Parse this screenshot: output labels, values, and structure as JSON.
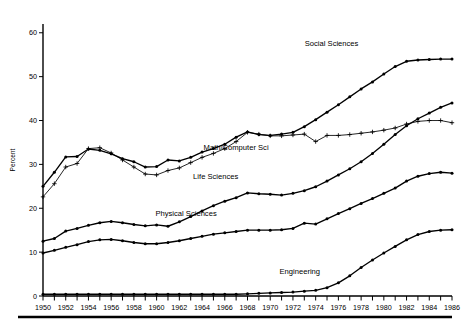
{
  "chart_data": {
    "type": "line",
    "title": "",
    "xlabel": "",
    "ylabel": "Percent",
    "xlim": [
      1950,
      1986
    ],
    "ylim": [
      0,
      62
    ],
    "yticks": [
      0,
      10,
      20,
      30,
      40,
      50,
      60
    ],
    "ytick_labels": [
      "0",
      "10",
      "20",
      "30",
      "40",
      "50",
      "60"
    ],
    "xticks": [
      1950,
      1951,
      1952,
      1953,
      1954,
      1955,
      1956,
      1957,
      1958,
      1959,
      1960,
      1961,
      1962,
      1963,
      1964,
      1965,
      1966,
      1967,
      1968,
      1969,
      1970,
      1971,
      1972,
      1973,
      1974,
      1975,
      1976,
      1977,
      1978,
      1979,
      1980,
      1981,
      1982,
      1983,
      1984,
      1985,
      1986
    ],
    "xtick_labels": [
      "1950",
      "1952",
      "1954",
      "1956",
      "1958",
      "1960",
      "1962",
      "1964",
      "1966",
      "1968",
      "1970",
      "1972",
      "1974",
      "1976",
      "1978",
      "1980",
      "1982",
      "1984",
      "1986"
    ],
    "xtick_label_years": [
      1950,
      1952,
      1954,
      1956,
      1958,
      1960,
      1962,
      1964,
      1966,
      1968,
      1970,
      1972,
      1974,
      1976,
      1978,
      1980,
      1982,
      1984,
      1986
    ],
    "grid": false,
    "legend_position": "inline-annotations",
    "x": [
      1950,
      1951,
      1952,
      1953,
      1954,
      1955,
      1956,
      1957,
      1958,
      1959,
      1960,
      1961,
      1962,
      1963,
      1964,
      1965,
      1966,
      1967,
      1968,
      1969,
      1970,
      1971,
      1972,
      1973,
      1974,
      1975,
      1976,
      1977,
      1978,
      1979,
      1980,
      1981,
      1982,
      1983,
      1984,
      1985,
      1986
    ],
    "series": [
      {
        "name": "Social Sciences",
        "marker": "dot",
        "line_weight": "thick",
        "label_x": 1975.4,
        "label_y": 57.0,
        "values": [
          25.0,
          28.2,
          31.7,
          31.8,
          33.5,
          33.2,
          32.4,
          31.3,
          30.6,
          29.4,
          29.5,
          31.0,
          30.8,
          31.6,
          32.8,
          33.6,
          34.6,
          36.2,
          37.4,
          36.8,
          36.6,
          36.9,
          37.3,
          38.6,
          40.2,
          41.9,
          43.6,
          45.4,
          47.2,
          48.8,
          50.6,
          52.3,
          53.5,
          53.8,
          53.9,
          54.0,
          54.0
        ]
      },
      {
        "name": "Math/Computer Sci",
        "marker": "plus",
        "line_weight": "thin",
        "label_x": 1967.0,
        "label_y": 33.4,
        "values": [
          22.6,
          25.6,
          29.4,
          30.2,
          33.6,
          33.8,
          32.6,
          31.0,
          29.4,
          27.8,
          27.6,
          28.6,
          29.2,
          30.4,
          31.6,
          32.5,
          33.6,
          35.2,
          37.3,
          36.9,
          36.5,
          36.5,
          36.7,
          36.9,
          35.2,
          36.6,
          36.6,
          36.8,
          37.1,
          37.4,
          37.8,
          38.3,
          39.2,
          39.8,
          40.0,
          40.0,
          39.5
        ]
      },
      {
        "name": "Life Sciences",
        "marker": "dot",
        "line_weight": "thick",
        "label_x": 1965.2,
        "label_y": 26.6,
        "values": [
          12.5,
          13.1,
          14.8,
          15.4,
          16.1,
          16.7,
          17.0,
          16.7,
          16.3,
          16.0,
          16.2,
          15.9,
          16.9,
          18.1,
          19.4,
          20.6,
          21.6,
          22.4,
          23.5,
          23.3,
          23.2,
          23.0,
          23.4,
          24.0,
          24.9,
          26.2,
          27.6,
          29.0,
          30.6,
          32.5,
          34.6,
          36.8,
          38.8,
          40.4,
          41.7,
          43.0,
          44.0
        ]
      },
      {
        "name": "Physical Sciences",
        "marker": "dot",
        "line_weight": "thick",
        "label_x": 1962.6,
        "label_y": 18.2,
        "values": [
          9.8,
          10.4,
          11.1,
          11.7,
          12.4,
          12.8,
          12.9,
          12.6,
          12.2,
          11.9,
          11.9,
          12.2,
          12.6,
          13.1,
          13.6,
          14.1,
          14.4,
          14.7,
          15.0,
          15.0,
          15.0,
          15.1,
          15.4,
          16.6,
          16.4,
          17.6,
          18.8,
          19.9,
          21.1,
          22.2,
          23.4,
          24.6,
          26.2,
          27.3,
          27.9,
          28.2,
          28.0
        ]
      },
      {
        "name": "Engineering",
        "marker": "dot",
        "line_weight": "thick",
        "label_x": 1972.6,
        "label_y": 5.0,
        "values": [
          0.4,
          0.4,
          0.4,
          0.4,
          0.4,
          0.4,
          0.4,
          0.4,
          0.4,
          0.4,
          0.4,
          0.4,
          0.4,
          0.4,
          0.4,
          0.4,
          0.4,
          0.4,
          0.5,
          0.6,
          0.7,
          0.8,
          0.9,
          1.1,
          1.3,
          1.9,
          3.0,
          4.6,
          6.5,
          8.2,
          9.8,
          11.3,
          12.8,
          14.0,
          14.7,
          15.0,
          15.1
        ]
      }
    ]
  }
}
